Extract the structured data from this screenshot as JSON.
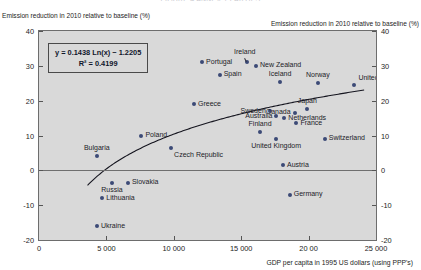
{
  "cut_title": "FIGURE 4 ANNEX 1 PARTIES",
  "axis_notes": {
    "left": "Emission reduction in 2010 relative to baseline (%)",
    "right": "Emission reduction in 2010 relative to baseline (%)"
  },
  "equation": {
    "line1": "y = 0.1438 Ln(x) − 1.2205",
    "line2": "R² = 0.4199"
  },
  "axis": {
    "y_ticks": [
      "40",
      "30",
      "20",
      "10",
      "0",
      "-10",
      "-20"
    ],
    "y_ticks_right": [
      "40",
      "30",
      "20",
      "10",
      "0",
      "-10",
      "-20"
    ],
    "x_ticks": [
      "0",
      "5 000",
      "10 000",
      "15 000",
      "20 00",
      "25 000"
    ],
    "x_title": "GDP per capita in 1995 US dollars (using PPP's)"
  },
  "chart_data": {
    "type": "scatter",
    "title": "FIGURE 4 ANNEX 1 PARTIES",
    "xlabel": "GDP per capita in 1995 US dollars (using PPP's)",
    "ylabel": "Emission reduction in 2010 relative to baseline (%)",
    "xlim": [
      0,
      25000
    ],
    "ylim": [
      -20,
      40
    ],
    "xticks": [
      0,
      5000,
      10000,
      15000,
      20000,
      25000
    ],
    "yticks": [
      -20,
      -10,
      0,
      10,
      20,
      30,
      40
    ],
    "grid": false,
    "legend": null,
    "trendline": {
      "kind": "logarithmic",
      "equation": "y = 0.1438 Ln(x) − 1.2205",
      "r_squared": 0.4199,
      "slope_coefficient": 0.1438,
      "intercept": -1.2205,
      "note": "plotted as percentage scale"
    },
    "points": [
      {
        "label": "Bulgaria",
        "x": 4300,
        "y": 4.0,
        "label_pos": "above"
      },
      {
        "label": "Ukraine",
        "x": 4300,
        "y": -16.0,
        "label_pos": "right"
      },
      {
        "label": "Lithuania",
        "x": 4700,
        "y": -8.0,
        "label_pos": "right"
      },
      {
        "label": "Russia",
        "x": 5400,
        "y": -3.5,
        "label_pos": "below"
      },
      {
        "label": "Slovakia",
        "x": 6600,
        "y": -3.5,
        "label_pos": "right"
      },
      {
        "label": "Poland",
        "x": 7600,
        "y": 10.0,
        "label_pos": "right"
      },
      {
        "label": "Czech Republic",
        "x": 9800,
        "y": 6.5,
        "label_pos": "below-right"
      },
      {
        "label": "Greece",
        "x": 11500,
        "y": 19.0,
        "label_pos": "right"
      },
      {
        "label": "Portugal",
        "x": 12100,
        "y": 31.0,
        "label_pos": "right"
      },
      {
        "label": "Spain",
        "x": 13400,
        "y": 27.5,
        "label_pos": "right"
      },
      {
        "label": "Ireland",
        "x": 15400,
        "y": 31.0,
        "label_pos": "above-leader"
      },
      {
        "label": "New Zealand",
        "x": 16100,
        "y": 30.0,
        "label_pos": "right"
      },
      {
        "label": "Finland",
        "x": 16400,
        "y": 11.0,
        "label_pos": "above"
      },
      {
        "label": "Sweden",
        "x": 17100,
        "y": 17.0,
        "label_pos": "left"
      },
      {
        "label": "Australia",
        "x": 17600,
        "y": 15.5,
        "label_pos": "left"
      },
      {
        "label": "United Kingdom",
        "x": 17600,
        "y": 9.0,
        "label_pos": "below"
      },
      {
        "label": "Iceland",
        "x": 17900,
        "y": 25.5,
        "label_pos": "above"
      },
      {
        "label": "Austria",
        "x": 18100,
        "y": 1.5,
        "label_pos": "right"
      },
      {
        "label": "Netherlands",
        "x": 18200,
        "y": 15.0,
        "label_pos": "right"
      },
      {
        "label": "Germany",
        "x": 18600,
        "y": -7.0,
        "label_pos": "right"
      },
      {
        "label": "Canada",
        "x": 19000,
        "y": 16.5,
        "label_pos": "left"
      },
      {
        "label": "France",
        "x": 19100,
        "y": 13.5,
        "label_pos": "right"
      },
      {
        "label": "Japan",
        "x": 19900,
        "y": 17.5,
        "label_pos": "above"
      },
      {
        "label": "Norway",
        "x": 20700,
        "y": 25.0,
        "label_pos": "above"
      },
      {
        "label": "Switzerland",
        "x": 21200,
        "y": 9.0,
        "label_pos": "right"
      },
      {
        "label": "United States",
        "x": 23400,
        "y": 24.5,
        "label_pos": "above-right"
      }
    ]
  }
}
